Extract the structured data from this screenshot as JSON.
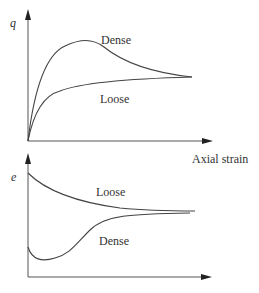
{
  "figure": {
    "top_plot": {
      "y_label": "q",
      "x_label": "Axial strain",
      "curves": [
        {
          "name": "Dense",
          "label": "Dense",
          "shape": "peak then soften to critical state"
        },
        {
          "name": "Loose",
          "label": "Loose",
          "shape": "monotonic hardening to critical state"
        }
      ]
    },
    "bottom_plot": {
      "y_label": "e",
      "curves": [
        {
          "name": "Loose",
          "label": "Loose",
          "shape": "monotonic decrease (contraction)"
        },
        {
          "name": "Dense",
          "label": "Dense",
          "shape": "initial dip then increase (dilation)"
        }
      ]
    },
    "colors": {
      "line": "#444444",
      "text": "#333333",
      "background": "#ffffff"
    }
  }
}
